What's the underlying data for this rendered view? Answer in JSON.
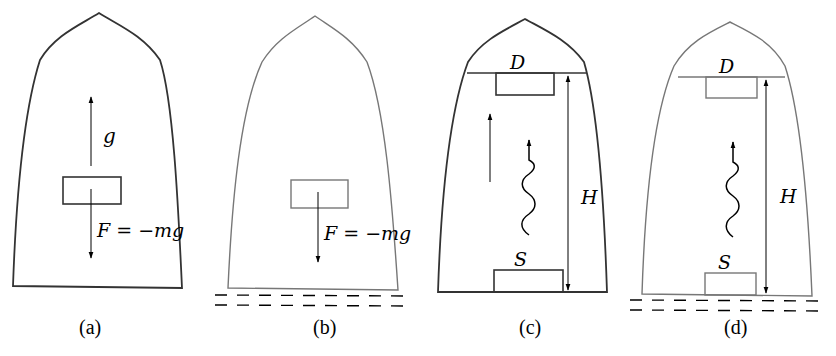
{
  "figure": {
    "panels": [
      {
        "id": "a",
        "caption": "(a)",
        "stroke_color": "#333333",
        "labels": {
          "acceleration": "g",
          "force": "F = −mg"
        },
        "has_ground": false
      },
      {
        "id": "b",
        "caption": "(b)",
        "stroke_color": "#777777",
        "labels": {
          "force": "F = −mg"
        },
        "has_ground": true
      },
      {
        "id": "c",
        "caption": "(c)",
        "stroke_color": "#333333",
        "labels": {
          "detector": "D",
          "source": "S",
          "height": "H"
        },
        "has_ground": false
      },
      {
        "id": "d",
        "caption": "(d)",
        "stroke_color": "#777777",
        "labels": {
          "detector": "D",
          "source": "S",
          "height": "H"
        },
        "has_ground": true
      }
    ]
  }
}
